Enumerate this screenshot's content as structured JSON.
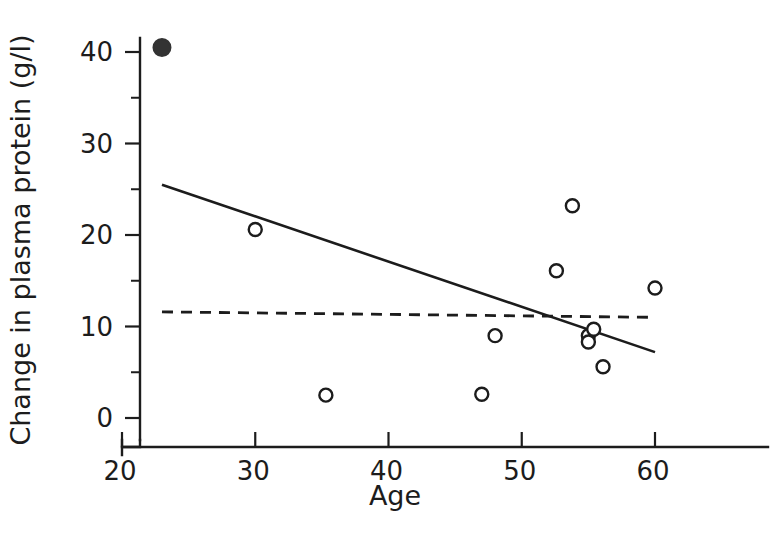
{
  "chart_data": {
    "type": "scatter",
    "title": "",
    "xlabel": "Age",
    "ylabel": "Change in plasma protein (g/l)",
    "xlim": [
      18.5,
      61.5
    ],
    "ylim": [
      -1.5,
      43.0
    ],
    "grid": false,
    "legend": "none",
    "xticks": [
      20,
      30,
      40,
      50,
      60
    ],
    "xtick_labels": [
      "20",
      "30",
      "40",
      "50",
      "60"
    ],
    "yticks": [
      0,
      10,
      20,
      30,
      40
    ],
    "ytick_labels": [
      "0",
      "10",
      "20",
      "30",
      "40"
    ],
    "y_minor_ticks": [
      5,
      15,
      25,
      35
    ],
    "series": [
      {
        "name": "outlier",
        "marker": "filled-circle",
        "points": [
          {
            "x": 23.0,
            "y": 40.5
          }
        ]
      },
      {
        "name": "observations",
        "marker": "open-circle",
        "points": [
          {
            "x": 30.0,
            "y": 20.6
          },
          {
            "x": 35.3,
            "y": 2.5
          },
          {
            "x": 47.0,
            "y": 2.6
          },
          {
            "x": 48.0,
            "y": 9.0
          },
          {
            "x": 52.6,
            "y": 16.1
          },
          {
            "x": 53.8,
            "y": 23.2
          },
          {
            "x": 55.0,
            "y": 9.0
          },
          {
            "x": 55.0,
            "y": 8.3
          },
          {
            "x": 55.4,
            "y": 9.7
          },
          {
            "x": 56.1,
            "y": 5.6
          },
          {
            "x": 60.0,
            "y": 14.2
          }
        ]
      }
    ],
    "lines": [
      {
        "name": "regression-all-data",
        "style": "solid",
        "x1": 23.0,
        "y1": 25.5,
        "x2": 60.0,
        "y2": 7.2
      },
      {
        "name": "regression-excluding-outlier",
        "style": "dashed",
        "x1": 23.0,
        "y1": 11.6,
        "x2": 60.0,
        "y2": 11.0
      }
    ]
  },
  "axes": {
    "x_title": "Age",
    "y_title": "Change in plasma protein (g/l)"
  }
}
